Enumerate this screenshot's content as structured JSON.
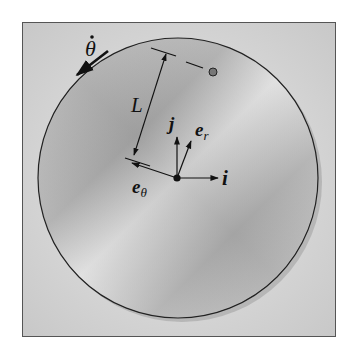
{
  "labels": {
    "theta_dot": "θ",
    "length": "L",
    "j": "j",
    "e_r": "e",
    "e_r_sub": "r",
    "e_theta": "e",
    "e_theta_sub": "θ",
    "i": "i"
  },
  "colors": {
    "background_panel": "#d8d8d8",
    "disc_light": "#e6e6e6",
    "disc_dark": "#9a9a9a",
    "ink": "#111111"
  }
}
